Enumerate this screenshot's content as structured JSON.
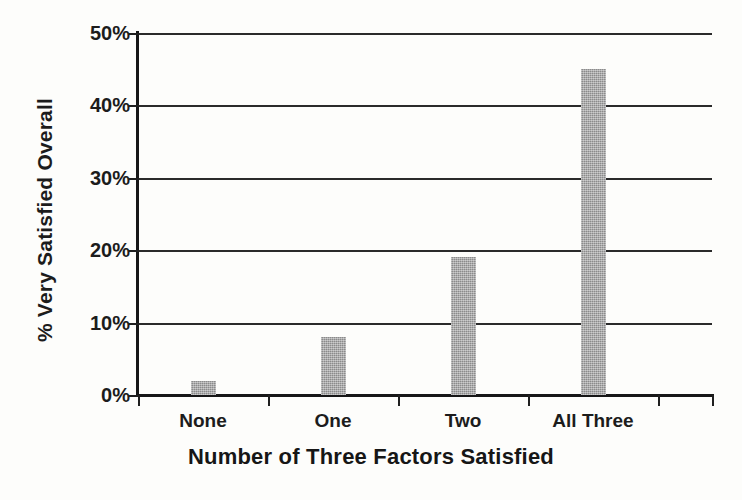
{
  "chart_data": {
    "type": "bar",
    "title": "",
    "categories": [
      "None",
      "One",
      "Two",
      "All Three"
    ],
    "values": [
      2,
      8,
      19,
      45
    ],
    "xlabel": "Number of Three Factors Satisfied",
    "ylabel": "% Very Satisfied Overall",
    "ylim": [
      0,
      50
    ],
    "ytick_values": [
      0,
      10,
      20,
      30,
      40,
      50
    ],
    "ytick_labels": [
      "0%",
      "10%",
      "20%",
      "30%",
      "40%",
      "50%"
    ],
    "grid": true,
    "grid_axis": "y",
    "legend": false,
    "legend_position": "none",
    "bar_color": "#9c9c9c",
    "axis_color": "#171717",
    "text_color": "#1c1c1c",
    "background_color": "#fdfdfb",
    "series": [
      {
        "name": "% Very Satisfied Overall",
        "values": [
          2,
          8,
          19,
          45
        ]
      }
    ]
  }
}
